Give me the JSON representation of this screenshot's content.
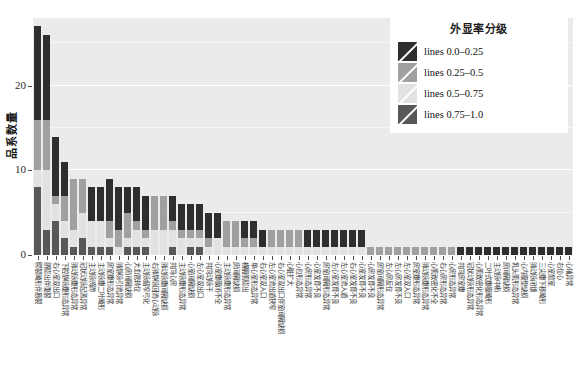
{
  "chart_data": {
    "type": "bar",
    "stacked": true,
    "title": "",
    "xlabel": "",
    "ylabel": "品系数量",
    "ylim": [
      0,
      28
    ],
    "yticks": [
      0,
      10,
      20
    ],
    "ytick_labels": [
      "0",
      "10",
      "20"
    ],
    "grid": true,
    "legend_position": "top-right",
    "legend_title": "外显率分级",
    "series": [
      {
        "name": "lines 0.0-0.25",
        "color": "#2e2e2e",
        "values": [
          11,
          10,
          7,
          4,
          0,
          0,
          4,
          4,
          5,
          5,
          3,
          4,
          4,
          0,
          0,
          3,
          3,
          3,
          3,
          3,
          3,
          0,
          0,
          2,
          2,
          2,
          0,
          0,
          0,
          0,
          2,
          2,
          2,
          2,
          2,
          2,
          2,
          0,
          0,
          0,
          0,
          0,
          0,
          0,
          0,
          0,
          0,
          1,
          1,
          1,
          1,
          1,
          1,
          1,
          1,
          1,
          1,
          1,
          1,
          1
        ]
      },
      {
        "name": "lines 0.25-0.5",
        "color": "#a0a0a0",
        "values": [
          6,
          6,
          1,
          3,
          6,
          4,
          0,
          0,
          2,
          2,
          3,
          1,
          1,
          4,
          4,
          1,
          1,
          1,
          1,
          1,
          0,
          3,
          3,
          1,
          1,
          0,
          2,
          2,
          2,
          2,
          0,
          0,
          0,
          0,
          0,
          0,
          0,
          1,
          1,
          1,
          1,
          1,
          1,
          1,
          1,
          1,
          1,
          0,
          0,
          0,
          0,
          0,
          0,
          0,
          0,
          0,
          0,
          0,
          0,
          0
        ]
      },
      {
        "name": "lines 0.5-0.75",
        "color": "#e2e2e2",
        "values": [
          2,
          7,
          2,
          2,
          2,
          3,
          3,
          3,
          1,
          1,
          1,
          2,
          1,
          3,
          3,
          2,
          2,
          1,
          1,
          1,
          2,
          1,
          1,
          1,
          1,
          1,
          1,
          1,
          1,
          1,
          1,
          1,
          1,
          1,
          1,
          1,
          1,
          0,
          0,
          0,
          0,
          0,
          0,
          0,
          0,
          0,
          0,
          0,
          0,
          0,
          0,
          0,
          0,
          0,
          0,
          0,
          0,
          0,
          0,
          0
        ]
      },
      {
        "name": "lines 0.75-1.0",
        "color": "#585858",
        "values": [
          8,
          3,
          4,
          2,
          1,
          2,
          1,
          1,
          1,
          0,
          1,
          1,
          1,
          0,
          0,
          1,
          0,
          1,
          1,
          0,
          0,
          0,
          0,
          0,
          0,
          0,
          0,
          0,
          0,
          0,
          0,
          0,
          0,
          0,
          0,
          0,
          0,
          0,
          0,
          0,
          0,
          0,
          0,
          0,
          0,
          0,
          0,
          0,
          0,
          0,
          0,
          0,
          0,
          0,
          0,
          0,
          0,
          0,
          0,
          0
        ]
      }
    ],
    "totals": [
      27,
      26,
      14,
      11,
      9,
      9,
      8,
      8,
      9,
      8,
      8,
      8,
      7,
      7,
      7,
      7,
      6,
      6,
      6,
      5,
      5,
      4,
      4,
      4,
      4,
      3,
      3,
      3,
      3,
      3,
      3,
      3,
      3,
      3,
      3,
      3,
      3,
      1,
      1,
      1,
      1,
      1,
      1,
      1,
      1,
      1,
      1,
      1,
      1,
      1,
      1,
      1,
      1,
      1,
      1,
      1,
      1,
      1,
      1,
      1
    ],
    "categories": [
      "腭裂畸形伴唇裂",
      "脐膨出伴腹裂",
      "右心室双出口",
      "下腔静脉瓣形态异常",
      "肺动脉瓣形态异常",
      "冠状动脉起源异常",
      "主动脉骑跨",
      "主动脉瓣二叶畸形",
      "房室瓣形态异常",
      "肺静脉引流异常",
      "心房间隔缺损",
      "大血管转位",
      "主动脉缩窄弓化",
      "右肺静脉回流心动脉",
      "肺动脉瓣间隔缺损",
      "共同心房",
      "主动脉瓣形态异常",
      "心室间隔缺损",
      "左心室双出口",
      "共同动脉干",
      "心室瓣膜闭不全",
      "主动脉瓣形态异常",
      "房间隔缺损",
      "横膈肌膨出",
      "单心室形态异常",
      "右心室双入口",
      "左心室流出道狭窄",
      "右心室双出口伴室间隔缺损",
      "心脏扩大",
      "心包形态异常",
      "心房形态异常",
      "心室发育不良",
      "房室间隔形态异常",
      "左心室发育不良",
      "左心室流入道",
      "右心室发育不良",
      "心室发育不良",
      "心房发育不良",
      "房室间隔形态异常",
      "左心房反位",
      "左心房发育不良",
      "左心室双入口",
      "房室瓣形态异常",
      "肺动脉瓣形态异常",
      "心肌致密化不全",
      "右心房形态异常",
      "心房形态异常",
      "共同房室瓣",
      "冠状动脉形态异常",
      "心肌致密化形态异常",
      "二叶式瓣膜畸形",
      "主动脉中断",
      "房间隔缺损",
      "乳头肌形态异常",
      "心内膜垫缺损",
      "肺动脉闭锁",
      "三尖瓣下移畸形",
      "心室憩室",
      "右位心",
      "心轴异常"
    ]
  },
  "legend": {
    "title": "外显率分级",
    "items": [
      {
        "label": "lines 0.0–0.25",
        "color": "#2e2e2e"
      },
      {
        "label": "lines 0.25–0.5",
        "color": "#a0a0a0"
      },
      {
        "label": "lines 0.5–0.75",
        "color": "#e2e2e2"
      },
      {
        "label": "lines 0.75–1.0",
        "color": "#585858"
      }
    ]
  },
  "axis": {
    "y_title": "品系数量",
    "y_ticks": [
      "0",
      "10",
      "20"
    ]
  }
}
